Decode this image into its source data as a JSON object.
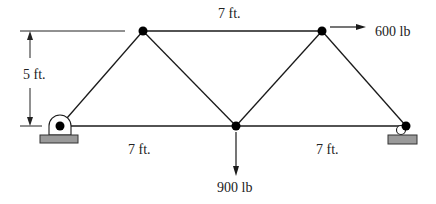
{
  "diagram": {
    "type": "planar truss",
    "joints": [
      {
        "id": "A",
        "x": 60,
        "y": 126,
        "role": "left pin support"
      },
      {
        "id": "B",
        "x": 143,
        "y": 31,
        "role": "top-left joint"
      },
      {
        "id": "C",
        "x": 236,
        "y": 126,
        "role": "bottom-middle joint"
      },
      {
        "id": "D",
        "x": 322,
        "y": 31,
        "role": "top-right joint"
      },
      {
        "id": "E",
        "x": 406,
        "y": 126,
        "role": "right roller support"
      }
    ],
    "members": [
      [
        "A",
        "B"
      ],
      [
        "B",
        "C"
      ],
      [
        "C",
        "D"
      ],
      [
        "D",
        "E"
      ],
      [
        "A",
        "C"
      ],
      [
        "C",
        "E"
      ],
      [
        "B",
        "D"
      ]
    ],
    "loads": [
      {
        "joint": "D",
        "label": "600 lb",
        "direction": "right"
      },
      {
        "joint": "C",
        "label": "900 lb",
        "direction": "down"
      }
    ],
    "dimensions": {
      "top_span": "7 ft.",
      "height": "5 ft.",
      "bottom_left_span": "7 ft.",
      "bottom_right_span": "7 ft."
    },
    "colors": {
      "member": "#1a1a1a",
      "support_base": "#9a9a9a",
      "joint": "#000000"
    }
  }
}
